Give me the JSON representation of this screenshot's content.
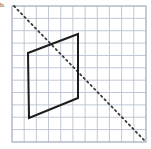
{
  "figure": {
    "label": "b.",
    "canvas": {
      "width": 151,
      "height": 149,
      "background": "#ffffff"
    },
    "grid": {
      "name": "graph-paper-grid",
      "x": 12,
      "y": 6,
      "width": 134,
      "height": 136,
      "columns": 11,
      "rows": 11,
      "cell_width": 12.18,
      "cell_height": 12.36,
      "line_color": "#b9c2d0",
      "line_width": 0.9,
      "border_color": "#a9b3c4",
      "border_width": 1.0
    },
    "shape": {
      "name": "parallelogram",
      "stroke": "#1c1c1c",
      "stroke_width": 2.0,
      "fill": "none",
      "vertices": [
        {
          "label": "top-left",
          "x": 28,
          "y": 53
        },
        {
          "label": "top-right",
          "x": 78,
          "y": 34
        },
        {
          "label": "bottom-right",
          "x": 78,
          "y": 98
        },
        {
          "label": "bottom-left",
          "x": 29,
          "y": 118
        }
      ],
      "points_attr": "28,53 78,34 78,98 29,118"
    },
    "line_of_reflection": {
      "name": "dashed-diagonal-line",
      "stroke": "#3a3a3a",
      "stroke_width": 1.8,
      "dash_pattern": "1.6 3.4",
      "linecap": "round",
      "x1": 14,
      "y1": 6,
      "x2": 144,
      "y2": 140
    }
  }
}
